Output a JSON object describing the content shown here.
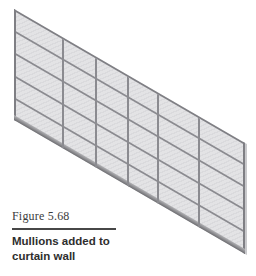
{
  "figure": {
    "label": "Figure 5.68",
    "caption": "Mullions added to curtain wall"
  },
  "illustration": {
    "description": "3D shaded view of a curtain wall with mullions on all grid lines",
    "panel_columns": 6,
    "panel_rows": 5,
    "wall_geometry": {
      "left_px": 14,
      "top_px": 9,
      "width_px": 231,
      "height_px": 111,
      "skew_deg": 30.1
    },
    "vertical_mullion_offsets_px": [
      48,
      81,
      113,
      143,
      184
    ],
    "horizontal_mullion_offsets_px": [
      21,
      43,
      66,
      88
    ],
    "colors": {
      "panel": "#e3e3e5",
      "mullion": "#8b8b90",
      "frame": "#7f7f84",
      "bottom_band_light": "#b3b3b6",
      "bottom_band_dark": "#6d6d71",
      "edge_highlight": "#c9c9cc"
    }
  }
}
